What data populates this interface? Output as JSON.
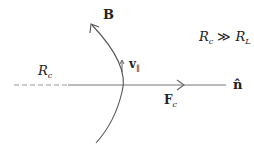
{
  "labels": {
    "B": "B",
    "v_par": "v",
    "v_par_sub": "∥",
    "Rc_left": "R",
    "Rc_left_sub": "c",
    "Fc": "F",
    "Fc_sub": "c",
    "n_hat": "n̂",
    "relation_R1": "R",
    "relation_R1_sub": "c",
    "relation_op": "≫",
    "relation_R2": "R",
    "relation_R2_sub": "L"
  },
  "colors": {
    "line": "#666666",
    "text": "#222222"
  }
}
